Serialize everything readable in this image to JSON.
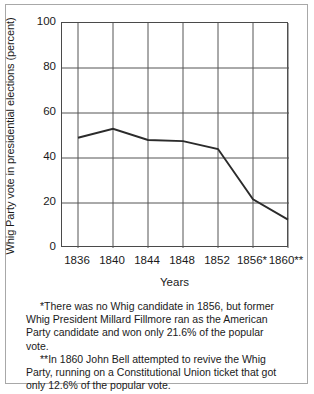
{
  "chart_data": {
    "type": "line",
    "title": "",
    "xlabel": "Years",
    "ylabel": "Whig Party vote in presidential elections (percent)",
    "categories": [
      "1836",
      "1840",
      "1844",
      "1848",
      "1852",
      "1856*",
      "1860**"
    ],
    "x": [
      1836,
      1840,
      1844,
      1848,
      1852,
      1856,
      1860
    ],
    "values": [
      49,
      53,
      48,
      47.5,
      44,
      21.6,
      12.6
    ],
    "series": [
      {
        "name": "Whig Party vote",
        "values": [
          49,
          53,
          48,
          47.5,
          44,
          21.6,
          12.6
        ]
      }
    ],
    "ylim": [
      0,
      100
    ],
    "yticks": [
      0,
      20,
      40,
      60,
      80,
      100
    ],
    "ytick_labels": [
      "0",
      "20",
      "40",
      "60",
      "80",
      "100"
    ],
    "grid": true,
    "legend": "none",
    "line_color": "#2b2b2b",
    "grid_color": "#555555",
    "axis_color": "#4a4a4a"
  },
  "footnotes": {
    "note1": "*There was no Whig candidate in 1856, but former Whig President Millard Fillmore ran as the American Party candidate and won only 21.6% of the popular vote.",
    "note2": "**In 1860 John Bell attempted to revive the Whig Party, running on a Constitutional Union ticket that got only 12.6% of the popular vote."
  }
}
